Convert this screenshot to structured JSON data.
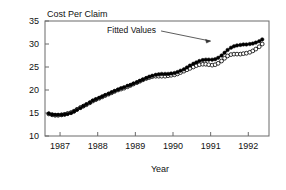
{
  "chart_data": {
    "type": "line",
    "title": "Cost Per Claim",
    "xlabel": "Year",
    "ylabel": "",
    "xlim": [
      1986.6,
      1992.55
    ],
    "ylim": [
      10,
      35
    ],
    "grid": false,
    "legend_position": "none",
    "y_ticks": [
      10,
      15,
      20,
      25,
      30,
      35
    ],
    "y_tick_labels": [
      "10",
      "15",
      "20",
      "25",
      "30",
      "35"
    ],
    "x_ticks": [
      1987,
      1988,
      1989,
      1990,
      1991,
      1992
    ],
    "x_tick_labels": [
      "1987",
      "1988",
      "1989",
      "1990",
      "1991",
      "1992"
    ],
    "annotations": [
      {
        "text": "Fitted Values",
        "x": 1989.55,
        "y": 32.4,
        "arrow_to_x": 1991.05,
        "arrow_to_y": 30.2
      }
    ],
    "x": [
      1986.7,
      1986.79,
      1986.87,
      1986.95,
      1987.04,
      1987.12,
      1987.2,
      1987.29,
      1987.37,
      1987.45,
      1987.54,
      1987.62,
      1987.7,
      1987.79,
      1987.87,
      1987.95,
      1988.04,
      1988.12,
      1988.2,
      1988.29,
      1988.37,
      1988.45,
      1988.54,
      1988.62,
      1988.7,
      1988.79,
      1988.87,
      1988.95,
      1989.04,
      1989.12,
      1989.2,
      1989.29,
      1989.37,
      1989.45,
      1989.54,
      1989.62,
      1989.7,
      1989.79,
      1989.87,
      1989.95,
      1990.04,
      1990.12,
      1990.2,
      1990.29,
      1990.37,
      1990.45,
      1990.54,
      1990.62,
      1990.7,
      1990.79,
      1990.87,
      1990.95,
      1991.04,
      1991.12,
      1991.2,
      1991.29,
      1991.37,
      1991.45,
      1991.54,
      1991.62,
      1991.7,
      1991.79,
      1991.87,
      1991.95,
      1992.04,
      1992.12,
      1992.2,
      1992.29,
      1992.37
    ],
    "series": [
      {
        "name": "Fitted Values",
        "marker": "filled-circle",
        "values": [
          14.9,
          14.7,
          14.6,
          14.6,
          14.6,
          14.7,
          14.8,
          15.0,
          15.3,
          15.7,
          16.1,
          16.5,
          16.9,
          17.3,
          17.7,
          18.0,
          18.3,
          18.6,
          18.9,
          19.2,
          19.5,
          19.8,
          20.1,
          20.4,
          20.6,
          20.9,
          21.1,
          21.4,
          21.7,
          22.0,
          22.3,
          22.6,
          22.9,
          23.1,
          23.3,
          23.4,
          23.5,
          23.5,
          23.5,
          23.6,
          23.7,
          23.9,
          24.2,
          24.5,
          24.9,
          25.3,
          25.7,
          26.0,
          26.3,
          26.5,
          26.6,
          26.6,
          26.6,
          26.7,
          27.0,
          27.5,
          28.1,
          28.7,
          29.2,
          29.5,
          29.7,
          29.8,
          29.9,
          29.9,
          30.0,
          30.1,
          30.3,
          30.6,
          31.0
        ]
      },
      {
        "name": "Observed Values",
        "marker": "open-circle",
        "values": [
          14.8,
          14.6,
          14.5,
          14.5,
          14.6,
          14.7,
          14.9,
          15.1,
          15.4,
          15.8,
          16.2,
          16.5,
          16.8,
          17.2,
          17.6,
          17.9,
          18.2,
          18.5,
          18.8,
          19.1,
          19.4,
          19.7,
          20.0,
          20.2,
          20.4,
          20.7,
          21.0,
          21.3,
          21.6,
          21.9,
          22.2,
          22.5,
          22.7,
          22.9,
          23.0,
          23.0,
          23.0,
          23.0,
          23.1,
          23.2,
          23.3,
          23.5,
          23.8,
          24.1,
          24.4,
          24.7,
          25.0,
          25.3,
          25.5,
          25.6,
          25.6,
          25.5,
          25.4,
          25.5,
          25.8,
          26.3,
          26.9,
          27.4,
          27.7,
          27.8,
          27.8,
          27.8,
          27.9,
          28.0,
          28.2,
          28.5,
          28.9,
          29.4,
          30.0
        ]
      }
    ]
  }
}
